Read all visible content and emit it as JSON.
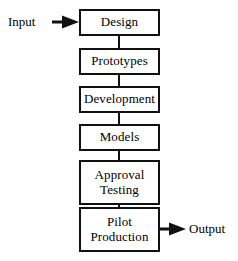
{
  "diagram": {
    "type": "vertical-flowchart",
    "stroke_color": "#111111",
    "fill_color": "#ffffff",
    "text_color": "#000000"
  },
  "input": {
    "label": "Input",
    "arrow_icon": "right-arrow-icon",
    "direction": "right",
    "target": "Design"
  },
  "output": {
    "label": "Output",
    "arrow_icon": "right-arrow-icon",
    "direction": "right",
    "source": "Pilot Production"
  },
  "nodes": [
    {
      "id": "design",
      "lines": [
        "Design"
      ]
    },
    {
      "id": "prototypes",
      "lines": [
        "Prototypes"
      ]
    },
    {
      "id": "development",
      "lines": [
        "Development"
      ]
    },
    {
      "id": "models",
      "lines": [
        "Models"
      ]
    },
    {
      "id": "approval",
      "lines": [
        "Approval",
        "Testing"
      ]
    },
    {
      "id": "pilot",
      "lines": [
        "Pilot",
        "Production"
      ]
    }
  ],
  "edges": [
    {
      "from": "Design",
      "to": "Prototypes"
    },
    {
      "from": "Prototypes",
      "to": "Development"
    },
    {
      "from": "Development",
      "to": "Models"
    },
    {
      "from": "Models",
      "to": "Approval Testing"
    },
    {
      "from": "Approval Testing",
      "to": "Pilot Production"
    }
  ]
}
